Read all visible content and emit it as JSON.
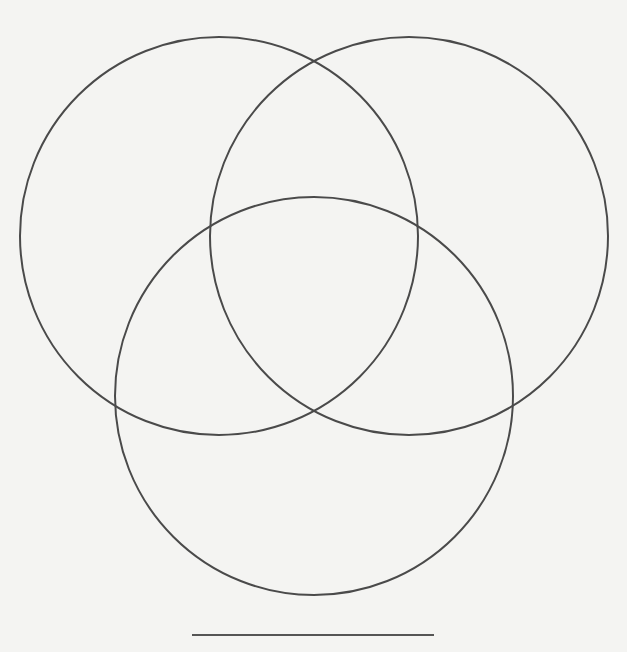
{
  "diagram": {
    "type": "venn",
    "set_count": 3,
    "background_color": "#f4f4f2",
    "stroke_color": "#4a4a4a",
    "circles": [
      {
        "name": "circle-a",
        "position": "top-left",
        "cx": 219,
        "cy": 236,
        "r": 199,
        "label": ""
      },
      {
        "name": "circle-b",
        "position": "top-right",
        "cx": 409,
        "cy": 236,
        "r": 199,
        "label": ""
      },
      {
        "name": "circle-c",
        "position": "bottom",
        "cx": 314,
        "cy": 396,
        "r": 199,
        "label": ""
      }
    ],
    "title_line": {
      "x1": 192,
      "y1": 635,
      "x2": 434,
      "y2": 635,
      "text": ""
    }
  }
}
